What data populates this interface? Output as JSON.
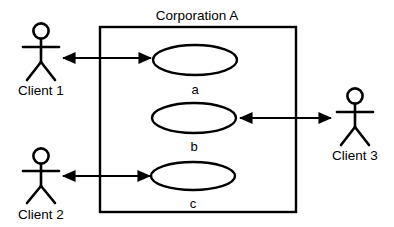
{
  "diagram": {
    "kind": "uml-use-case-diagram",
    "background_color": "#ffffff",
    "line_color": "#000000",
    "system": {
      "title": "Corporation A",
      "boundary": {
        "x": 100,
        "y": 27,
        "width": 196,
        "height": 185
      }
    },
    "use_cases": [
      {
        "id": "a",
        "label": "a",
        "cx": 195,
        "cy": 60,
        "rx": 42,
        "ry": 15,
        "label_x": 195,
        "label_y": 89
      },
      {
        "id": "b",
        "label": "b",
        "cx": 194,
        "cy": 118,
        "rx": 42,
        "ry": 15,
        "label_x": 194,
        "label_y": 146
      },
      {
        "id": "c",
        "label": "c",
        "cx": 193,
        "cy": 176,
        "rx": 42,
        "ry": 14,
        "label_x": 193,
        "label_y": 204
      }
    ],
    "actors": [
      {
        "id": "client-1",
        "label": "Client 1",
        "x": 41,
        "y": 30,
        "label_x": 41,
        "label_y": 91
      },
      {
        "id": "client-2",
        "label": "Client 2",
        "x": 41,
        "y": 155,
        "label_x": 41,
        "label_y": 215
      },
      {
        "id": "client-3",
        "label": "Client 3",
        "x": 355,
        "y": 95,
        "label_x": 355,
        "label_y": 156
      }
    ],
    "associations": [
      {
        "id": "client-1-to-a",
        "from": "client-1",
        "to": "a",
        "arrow": "both",
        "x1": 63,
        "y1": 58,
        "x2": 151,
        "y2": 58
      },
      {
        "id": "client-3-to-b",
        "from": "client-3",
        "to": "b",
        "arrow": "both",
        "x1": 240,
        "y1": 118,
        "x2": 331,
        "y2": 118
      },
      {
        "id": "client-2-to-c",
        "from": "client-2",
        "to": "c",
        "arrow": "both",
        "x1": 63,
        "y1": 176,
        "x2": 150,
        "y2": 176
      }
    ]
  }
}
